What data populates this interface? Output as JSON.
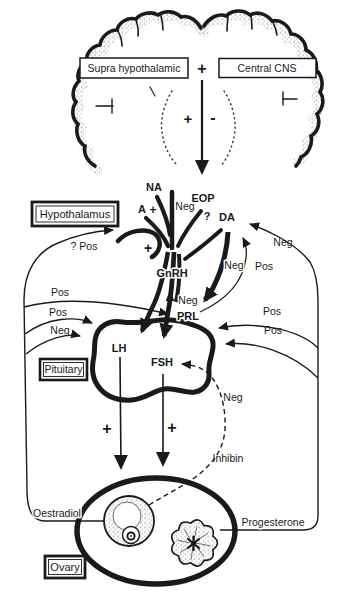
{
  "colors": {
    "ink": "#1a1a1a",
    "paper": "#ffffff"
  },
  "brain": {
    "supra_hypothalamic": "Supra hypothalamic",
    "central_cns": "Central CNS",
    "plus": "+",
    "stim": "+",
    "inhib": "-"
  },
  "hypothalamus": {
    "label": "Hypothalamus",
    "na": "NA",
    "a": "A",
    "eop": "EOP",
    "da": "DA",
    "question": "?",
    "gnrh": "GnRH"
  },
  "pituitary": {
    "label": "Pituitary",
    "prl": "PRL",
    "lh": "LH",
    "fsh": "FSH"
  },
  "ovary": {
    "label": "Ovary",
    "oestradiol": "Oestradiol",
    "progesterone": "Progesterone",
    "inhibin": "Inhibin"
  },
  "signs": {
    "plus": "+",
    "minus": "-"
  },
  "feedback": {
    "pos": "Pos",
    "neg": "Neg",
    "q_pos": "? Pos"
  }
}
